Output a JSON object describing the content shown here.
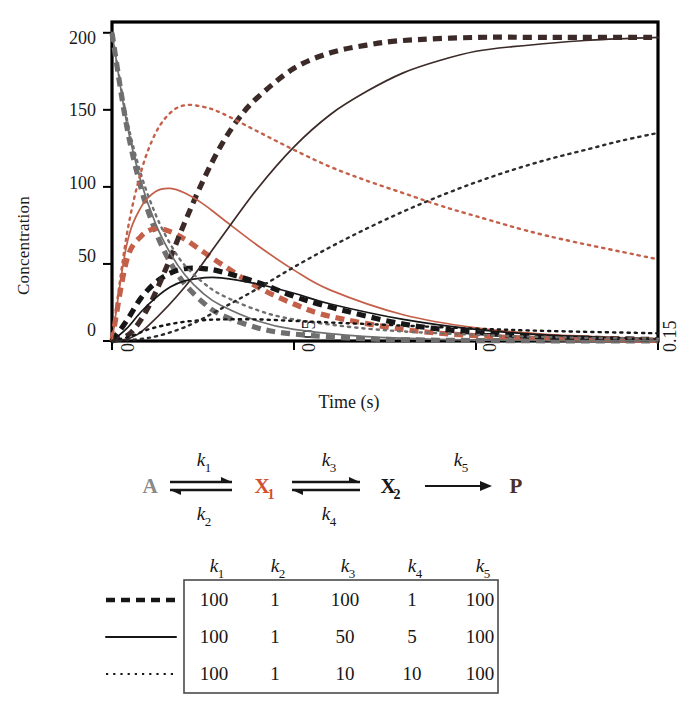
{
  "axes": {
    "ylabel": "Concentration",
    "xlabel": "Time (s)",
    "yticks": [
      "0",
      "50",
      "100",
      "150",
      "200"
    ],
    "xticks": [
      "0",
      "0.05",
      "0.1",
      "0.15"
    ]
  },
  "colors": {
    "red": "#c4604a",
    "black": "#161616",
    "gray": "#6f6f6f",
    "frame": "#000000",
    "table_border": "#4a4a4a"
  },
  "scheme": {
    "species": [
      {
        "id": "A",
        "label": "A",
        "sub": "",
        "color": "#8a8a8a"
      },
      {
        "id": "X1",
        "label": "X",
        "sub": "1",
        "color": "#d24f2f"
      },
      {
        "id": "X2",
        "label": "X",
        "sub": "2",
        "color": "#161616"
      },
      {
        "id": "P",
        "label": "P",
        "sub": "",
        "color": "#4a2f2a"
      }
    ],
    "rate_labels": [
      {
        "id": "k1",
        "k": "k",
        "sub": "1",
        "position": "above-first"
      },
      {
        "id": "k2",
        "k": "k",
        "sub": "2",
        "position": "below-first"
      },
      {
        "id": "k3",
        "k": "k",
        "sub": "3",
        "position": "above-second"
      },
      {
        "id": "k4",
        "k": "k",
        "sub": "4",
        "position": "below-second"
      },
      {
        "id": "k5",
        "k": "k",
        "sub": "5",
        "position": "above-third"
      }
    ]
  },
  "table": {
    "headers": [
      {
        "k": "k",
        "sub": "1"
      },
      {
        "k": "k",
        "sub": "2"
      },
      {
        "k": "k",
        "sub": "3"
      },
      {
        "k": "k",
        "sub": "4"
      },
      {
        "k": "k",
        "sub": "5"
      }
    ],
    "rows": [
      {
        "style": "thick-dashed",
        "values": [
          "100",
          "1",
          "100",
          "1",
          "100"
        ]
      },
      {
        "style": "solid",
        "values": [
          "100",
          "1",
          "50",
          "5",
          "100"
        ]
      },
      {
        "style": "fine-dotted",
        "values": [
          "100",
          "1",
          "10",
          "10",
          "100"
        ]
      }
    ]
  },
  "chart_data": {
    "type": "line",
    "title": "",
    "xlabel": "Time (s)",
    "ylabel": "Concentration",
    "xlim": [
      0,
      0.15
    ],
    "ylim": [
      0,
      207
    ],
    "xticks": [
      0,
      0.05,
      0.1,
      0.15
    ],
    "yticks": [
      0,
      50,
      100,
      150,
      200
    ],
    "grid": false,
    "legend": "table-below",
    "note": "Kinetics of A <-> X1 <-> X2 -> P for three parameter sets; concentrations in arbitrary units, A0 = 200.",
    "series": [
      {
        "name": "A (set 1: k3=100, k4=1)",
        "species": "A",
        "param_set": 1,
        "style": "thick-dashed",
        "color": "#6f6f6f",
        "x": [
          0,
          0.004,
          0.008,
          0.012,
          0.016,
          0.02,
          0.025,
          0.03,
          0.04,
          0.05,
          0.07,
          0.09,
          0.11,
          0.13,
          0.15
        ],
        "y": [
          200,
          140,
          99,
          71,
          51,
          37,
          25,
          17,
          8.5,
          4.5,
          1.4,
          0.5,
          0.2,
          0.1,
          0.05
        ]
      },
      {
        "name": "X1 (set 1: k3=100, k4=1)",
        "species": "X1",
        "param_set": 1,
        "style": "thick-dashed",
        "color": "#c4604a",
        "x": [
          0,
          0.004,
          0.008,
          0.012,
          0.016,
          0.02,
          0.025,
          0.03,
          0.04,
          0.05,
          0.06,
          0.08,
          0.1,
          0.12,
          0.15
        ],
        "y": [
          0,
          52,
          68,
          73,
          71,
          66,
          58,
          50,
          35,
          24,
          16,
          7.5,
          3.4,
          1.6,
          0.5
        ]
      },
      {
        "name": "X2 (set 1: k3=100, k4=1)",
        "species": "X2",
        "param_set": 1,
        "style": "thick-dashed",
        "color": "#161616",
        "x": [
          0,
          0.004,
          0.008,
          0.012,
          0.016,
          0.02,
          0.025,
          0.03,
          0.04,
          0.05,
          0.06,
          0.08,
          0.1,
          0.12,
          0.15
        ],
        "y": [
          0,
          13,
          28,
          38,
          44,
          47,
          47,
          45,
          38,
          29,
          22,
          11,
          5.5,
          2.6,
          0.9
        ]
      },
      {
        "name": "P (set 1: k3=100, k4=1)",
        "species": "P",
        "param_set": 1,
        "style": "thick-dashed",
        "color": "#3b2a28",
        "x": [
          0,
          0.005,
          0.01,
          0.015,
          0.02,
          0.025,
          0.03,
          0.035,
          0.04,
          0.05,
          0.06,
          0.07,
          0.08,
          0.1,
          0.12,
          0.15
        ],
        "y": [
          0,
          5,
          22,
          48,
          77,
          104,
          127,
          145,
          158,
          177,
          187,
          192,
          195,
          197,
          197,
          197
        ]
      },
      {
        "name": "A (set 2: k3=50, k4=5)",
        "species": "A",
        "param_set": 2,
        "style": "solid",
        "color": "#6f6f6f",
        "x": [
          0,
          0.004,
          0.008,
          0.012,
          0.016,
          0.02,
          0.025,
          0.03,
          0.04,
          0.05,
          0.07,
          0.09,
          0.11,
          0.13,
          0.15
        ],
        "y": [
          200,
          142,
          103,
          76,
          57,
          43,
          31,
          23,
          13,
          7.5,
          2.8,
          1.1,
          0.5,
          0.2,
          0.1
        ]
      },
      {
        "name": "X1 (set 2: k3=50, k4=5)",
        "species": "X1",
        "param_set": 2,
        "style": "solid",
        "color": "#c4604a",
        "x": [
          0,
          0.004,
          0.008,
          0.012,
          0.016,
          0.02,
          0.025,
          0.03,
          0.04,
          0.05,
          0.06,
          0.08,
          0.1,
          0.12,
          0.15
        ],
        "y": [
          0,
          62,
          87,
          97,
          99,
          96,
          89,
          80,
          62,
          46,
          33,
          17,
          8.5,
          4.2,
          1.4
        ]
      },
      {
        "name": "X2 (set 2: k3=50, k4=5)",
        "species": "X2",
        "param_set": 2,
        "style": "solid",
        "color": "#161616",
        "x": [
          0,
          0.004,
          0.008,
          0.012,
          0.016,
          0.02,
          0.025,
          0.03,
          0.04,
          0.05,
          0.06,
          0.08,
          0.1,
          0.12,
          0.15
        ],
        "y": [
          0,
          8,
          19,
          28,
          35,
          39,
          41,
          41,
          37,
          31,
          24,
          14,
          7.5,
          3.8,
          1.3
        ]
      },
      {
        "name": "P (set 2: k3=50, k4=5)",
        "species": "P",
        "param_set": 2,
        "style": "solid",
        "color": "#3b2a28",
        "x": [
          0,
          0.005,
          0.01,
          0.02,
          0.03,
          0.04,
          0.05,
          0.06,
          0.07,
          0.08,
          0.09,
          0.1,
          0.11,
          0.13,
          0.15
        ],
        "y": [
          0,
          2,
          10,
          35,
          67,
          99,
          126,
          147,
          162,
          174,
          182,
          188,
          191,
          195,
          197
        ]
      },
      {
        "name": "A (set 3: k3=10, k4=10)",
        "species": "A",
        "param_set": 3,
        "style": "fine-dotted",
        "color": "#6f6f6f",
        "x": [
          0,
          0.004,
          0.008,
          0.012,
          0.016,
          0.02,
          0.025,
          0.03,
          0.04,
          0.05,
          0.07,
          0.09,
          0.12,
          0.15
        ],
        "y": [
          200,
          145,
          108,
          82,
          63,
          49,
          38,
          30,
          20,
          14,
          8,
          5,
          2.5,
          1.5
        ]
      },
      {
        "name": "X1 (set 3: k3=10, k4=10)",
        "species": "X1",
        "param_set": 3,
        "style": "fine-dotted",
        "color": "#c4604a",
        "x": [
          0,
          0.004,
          0.008,
          0.012,
          0.016,
          0.02,
          0.025,
          0.03,
          0.04,
          0.05,
          0.06,
          0.07,
          0.08,
          0.09,
          0.1,
          0.12,
          0.15
        ],
        "y": [
          0,
          68,
          110,
          135,
          148,
          153,
          152,
          148,
          136,
          124,
          113,
          104,
          96,
          88,
          81,
          68,
          53
        ]
      },
      {
        "name": "X2 (set 3: k3=10, k4=10)",
        "species": "X2",
        "param_set": 3,
        "style": "fine-dotted",
        "color": "#161616",
        "x": [
          0,
          0.005,
          0.01,
          0.015,
          0.02,
          0.025,
          0.03,
          0.04,
          0.05,
          0.06,
          0.08,
          0.1,
          0.12,
          0.15
        ],
        "y": [
          0,
          3,
          7.5,
          10.5,
          12.5,
          13.5,
          14,
          14,
          13,
          12,
          10,
          8,
          6.5,
          5
        ]
      },
      {
        "name": "P (set 3: k3=10, k4=10)",
        "species": "P",
        "param_set": 3,
        "style": "fine-dotted",
        "color": "#2b2b2b",
        "x": [
          0,
          0.01,
          0.02,
          0.03,
          0.04,
          0.05,
          0.06,
          0.07,
          0.08,
          0.09,
          0.1,
          0.11,
          0.12,
          0.13,
          0.14,
          0.15
        ],
        "y": [
          0,
          2,
          9,
          21,
          34,
          48,
          61,
          73,
          84,
          94,
          103,
          111,
          118,
          124,
          130,
          135
        ]
      }
    ]
  }
}
